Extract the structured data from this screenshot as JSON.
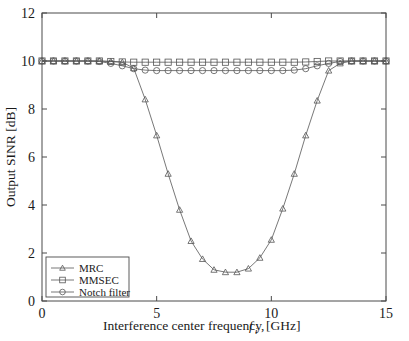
{
  "figure": {
    "name": "output-sinr-vs-interference-frequency",
    "background": "#ffffff",
    "line_color": "#555555",
    "axis_color": "#4a4a4a"
  },
  "axes": {
    "x_title_main": "Interference center frequency,",
    "x_title_symbol": "f",
    "x_title_subscript": "i",
    "x_title_units": "[GHz]",
    "y_title": "Output SINR [dB]",
    "x_ticks": [
      "0",
      "5",
      "10",
      "15"
    ],
    "y_ticks": [
      "0",
      "2",
      "4",
      "6",
      "8",
      "10",
      "12"
    ]
  },
  "legend": {
    "items": [
      {
        "label": "MRC",
        "marker": "triangle-marker"
      },
      {
        "label": "MMSEC",
        "marker": "square-marker"
      },
      {
        "label": "Notch filter",
        "marker": "circle-marker"
      }
    ]
  },
  "chart_data": {
    "type": "line",
    "title": "",
    "xlabel": "Interference center frequency, f_i [GHz]",
    "ylabel": "Output SINR [dB]",
    "xlim": [
      0,
      15
    ],
    "ylim": [
      0,
      12
    ],
    "xticks": [
      0,
      5,
      10,
      15
    ],
    "yticks": [
      0,
      2,
      4,
      6,
      8,
      10,
      12
    ],
    "grid": false,
    "legend_position": "lower-left",
    "x": [
      0,
      0.5,
      1,
      1.5,
      2,
      2.5,
      3,
      3.5,
      4,
      4.5,
      5,
      5.5,
      6,
      6.5,
      7,
      7.5,
      8,
      8.5,
      9,
      9.5,
      10,
      10.5,
      11,
      11.5,
      12,
      12.5,
      13,
      13.5,
      14,
      14.5,
      15
    ],
    "series": [
      {
        "name": "MRC",
        "marker": "triangle",
        "values": [
          10.0,
          10.0,
          10.0,
          10.0,
          10.0,
          10.0,
          9.98,
          9.95,
          9.7,
          8.4,
          6.9,
          5.3,
          3.8,
          2.5,
          1.75,
          1.3,
          1.2,
          1.2,
          1.35,
          1.8,
          2.55,
          3.85,
          5.3,
          6.9,
          8.35,
          9.6,
          9.9,
          10.0,
          10.0,
          10.0,
          10.0
        ]
      },
      {
        "name": "MMSEC",
        "marker": "square",
        "values": [
          10.0,
          10.0,
          10.0,
          10.0,
          10.0,
          10.0,
          9.98,
          9.96,
          9.95,
          9.95,
          9.95,
          9.95,
          9.95,
          9.95,
          9.95,
          9.95,
          9.95,
          9.95,
          9.95,
          9.95,
          9.95,
          9.95,
          9.95,
          9.96,
          9.98,
          10.0,
          10.0,
          10.0,
          10.0,
          10.0,
          10.0
        ]
      },
      {
        "name": "Notch filter",
        "marker": "circle",
        "values": [
          10.0,
          10.0,
          10.0,
          10.0,
          10.0,
          9.98,
          9.9,
          9.8,
          9.68,
          9.62,
          9.6,
          9.6,
          9.6,
          9.6,
          9.6,
          9.6,
          9.6,
          9.6,
          9.6,
          9.6,
          9.6,
          9.6,
          9.62,
          9.68,
          9.8,
          9.9,
          9.98,
          10.0,
          10.0,
          10.0,
          10.0
        ]
      }
    ]
  }
}
